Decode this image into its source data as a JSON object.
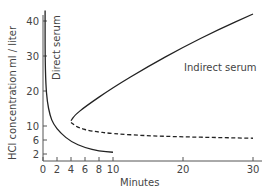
{
  "chart_data": {
    "type": "line",
    "title": "",
    "xlabel": "Minutes",
    "ylabel": "HCl concentration  ml / liter",
    "xlim": [
      0,
      31
    ],
    "ylim": [
      0,
      44
    ],
    "x_ticks": [
      0,
      2,
      4,
      6,
      8,
      10,
      20,
      30
    ],
    "y_ticks": [
      2,
      6,
      10,
      20,
      30,
      40
    ],
    "grid": false,
    "legend": "inline labels",
    "series": [
      {
        "name": "Direct serum",
        "style": "solid",
        "x": [
          0.3,
          0.3,
          0.4,
          0.6,
          1.0,
          1.5,
          2.5,
          4.0,
          6.0,
          8.0,
          10.0
        ],
        "y": [
          43,
          30,
          22,
          17,
          13,
          10.5,
          8,
          5.5,
          3.8,
          2.8,
          2.5
        ]
      },
      {
        "name": "Indirect serum",
        "style": "solid",
        "x": [
          4.0,
          4.5,
          6.0,
          10,
          15,
          20,
          25,
          30
        ],
        "y": [
          11.5,
          13,
          15.5,
          21,
          27,
          32.5,
          37.5,
          42
        ]
      },
      {
        "name": "Indirect serum (lower branch)",
        "style": "dashed",
        "x": [
          4.0,
          5.0,
          7.0,
          10,
          15,
          20,
          25,
          30
        ],
        "y": [
          11,
          9.5,
          8.5,
          7.8,
          7.2,
          6.9,
          6.7,
          6.5
        ]
      }
    ],
    "annotations": [
      "Direct serum",
      "Indirect serum"
    ]
  },
  "labels": {
    "ylabel_main": "HCl concentration",
    "ylabel_unit": "ml / liter",
    "xlabel": "Minutes",
    "direct": "Direct serum",
    "indirect": "Indirect serum",
    "xt": [
      "0",
      "2",
      "4",
      "6",
      "8",
      "10",
      "20",
      "30"
    ],
    "yt": [
      "2",
      "6",
      "10",
      "20",
      "30",
      "40"
    ]
  }
}
